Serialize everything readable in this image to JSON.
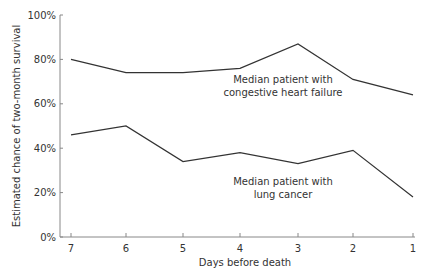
{
  "chart_data": {
    "type": "line",
    "title": "",
    "xlabel": "Days before death",
    "ylabel": "Estimated chance of two-month survival",
    "categories": [
      "7",
      "6",
      "5",
      "4",
      "3",
      "2",
      "1"
    ],
    "series": [
      {
        "name": "Median patient with congestive heart failure",
        "values": [
          80,
          74,
          74,
          76,
          87,
          71,
          64
        ]
      },
      {
        "name": "Median patient with lung cancer",
        "values": [
          46,
          50,
          34,
          38,
          33,
          39,
          18
        ]
      }
    ],
    "y_ticks": [
      "0%",
      "20%",
      "40%",
      "60%",
      "80%",
      "100%"
    ],
    "ylim": [
      0,
      100
    ],
    "grid": false,
    "legend": "none (inline annotations)",
    "annotations": [
      {
        "line1": "Median patient with",
        "line2": "congestive heart failure"
      },
      {
        "line1": "Median patient with",
        "line2": "lung cancer"
      }
    ]
  }
}
